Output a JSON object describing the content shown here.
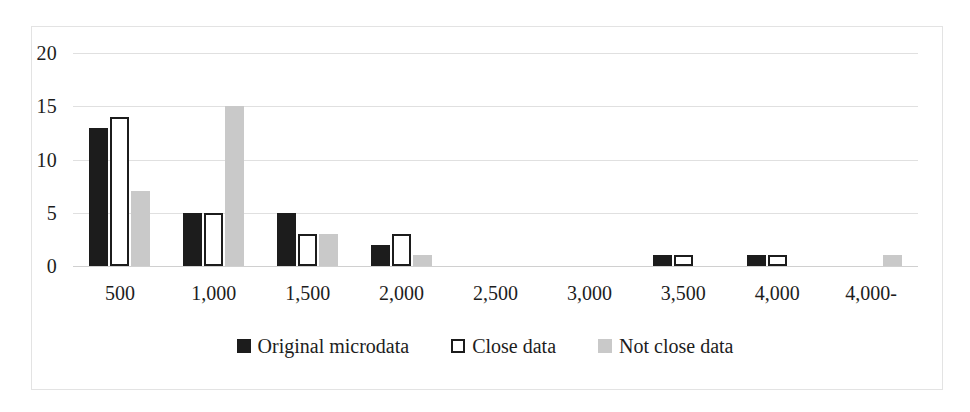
{
  "chart_data": {
    "type": "bar",
    "title": "",
    "subtitle": "",
    "xlabel": "",
    "ylabel": "",
    "ylim": [
      0,
      20
    ],
    "yticks": [
      "0",
      "5",
      "10",
      "15",
      "20"
    ],
    "ytick_values": [
      0,
      5,
      10,
      15,
      20
    ],
    "grid": true,
    "legend_position": "bottom",
    "categories": [
      "500",
      "1,000",
      "1,500",
      "2,000",
      "2,500",
      "3,000",
      "3,500",
      "4,000",
      "4,000-"
    ],
    "series": [
      {
        "name": "Original microdata",
        "color": "#1c1c1c",
        "style": "filled",
        "values": [
          13,
          5,
          5,
          2,
          0,
          0,
          1,
          1,
          0
        ]
      },
      {
        "name": "Close data",
        "color": "#ffffff",
        "style": "outlined",
        "values": [
          14,
          5,
          3,
          3,
          0,
          0,
          1,
          1,
          0
        ]
      },
      {
        "name": "Not close data",
        "color": "#c9c9c9",
        "style": "filled",
        "values": [
          7,
          15,
          3,
          1,
          0,
          0,
          0,
          0,
          1
        ]
      }
    ]
  },
  "legend": {
    "items": [
      {
        "label": "Original microdata"
      },
      {
        "label": "Close data"
      },
      {
        "label": "Not close data"
      }
    ]
  },
  "axes": {
    "y": {
      "labels": [
        "20",
        "15",
        "10",
        "5",
        "0"
      ]
    },
    "x": {
      "labels": [
        "500",
        "1,000",
        "1,500",
        "2,000",
        "2,500",
        "3,000",
        "3,500",
        "4,000",
        "4,000-"
      ]
    }
  },
  "colors": {
    "series_dark": "#1c1c1c",
    "series_white": "#ffffff",
    "series_gray": "#c9c9c9",
    "gridline": "#e0e0e0",
    "frame": "#e3e3e3",
    "text": "#1d1d1d"
  }
}
